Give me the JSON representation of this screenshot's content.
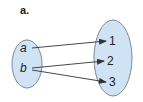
{
  "diagram": {
    "label": "a.",
    "domain_set": {
      "elements": [
        "a",
        "b"
      ],
      "fill": "#cfe3f5",
      "stroke": "#7a8a99"
    },
    "codomain_set": {
      "elements": [
        "1",
        "2",
        "3"
      ],
      "fill": "#cfe3f5",
      "stroke": "#7a8a99"
    },
    "mappings": [
      {
        "from": "a",
        "to": "1"
      },
      {
        "from": "b",
        "to": "2"
      },
      {
        "from": "b",
        "to": "3"
      }
    ],
    "arrow_color": "#333333"
  }
}
